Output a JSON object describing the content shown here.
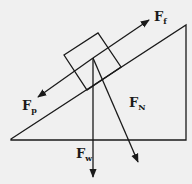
{
  "diagram": {
    "colors": {
      "background": "#f0f0f0",
      "stroke": "#1a1a1a"
    },
    "labels": {
      "ff": {
        "main": "F",
        "sub": "f"
      },
      "fp": {
        "main": "F",
        "sub": "p"
      },
      "fn": {
        "main": "F",
        "sub": "N"
      },
      "fw": {
        "main": "F",
        "sub": "w"
      }
    }
  }
}
